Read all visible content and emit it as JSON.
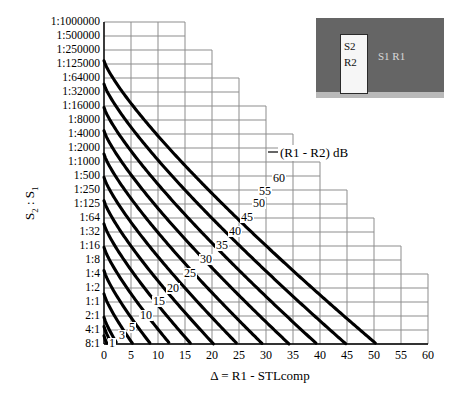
{
  "chart_data": {
    "type": "line",
    "title": "",
    "xlabel": "Δ = R1 - STLcomp",
    "ylabel": "S2 : S1",
    "legend_title": "(R1 - R2) dB",
    "legend_position": "inline-on-curves",
    "grid": true,
    "xlim": [
      0,
      60
    ],
    "xticks": [
      0,
      5,
      10,
      15,
      20,
      25,
      30,
      35,
      40,
      45,
      50,
      55,
      60
    ],
    "xticklabels": [
      "0",
      "5",
      "10",
      "15",
      "20",
      "25",
      "30",
      "35",
      "40",
      "45",
      "50",
      "55",
      "60"
    ],
    "yticklabels": [
      "1:1000000",
      "1:500000",
      "1:250000",
      "1:125000",
      "1:64000",
      "1:32000",
      "1:16000",
      "1:8000",
      "1:4000",
      "1:2000",
      "1:1000",
      "1:500",
      "1:250",
      "1:125",
      "1:64",
      "1:32",
      "1:16",
      "1:8",
      "1:4",
      "1:2",
      "1:1",
      "2:1",
      "4:1",
      "8:1"
    ],
    "y_scale": "log2-ratio",
    "series_label_unit": "dB",
    "series": [
      {
        "name": "1",
        "label": "1",
        "values_dB": 1
      },
      {
        "name": "3",
        "label": "3",
        "values_dB": 3
      },
      {
        "name": "5",
        "label": "5",
        "values_dB": 5
      },
      {
        "name": "10",
        "label": "10",
        "values_dB": 10
      },
      {
        "name": "15",
        "label": "15",
        "values_dB": 15
      },
      {
        "name": "20",
        "label": "20",
        "values_dB": 20
      },
      {
        "name": "25",
        "label": "25",
        "values_dB": 25
      },
      {
        "name": "30",
        "label": "30",
        "values_dB": 30
      },
      {
        "name": "35",
        "label": "35",
        "values_dB": 35
      },
      {
        "name": "40",
        "label": "40",
        "values_dB": 40
      },
      {
        "name": "45",
        "label": "45",
        "values_dB": 45
      },
      {
        "name": "50",
        "label": "50",
        "values_dB": 50
      },
      {
        "name": "55",
        "label": "55",
        "values_dB": 55
      },
      {
        "name": "60",
        "label": "60",
        "values_dB": 60
      }
    ]
  },
  "inset": {
    "name": "partition-diagram",
    "source_room_label": "S1  R1",
    "receiver_panel_line1": "S2",
    "receiver_panel_line2": "R2",
    "wall_color": "#656565",
    "door_color": "#f6f6f6",
    "floor_color": "#b9b9b9"
  },
  "colors": {
    "grid": "#8d8d8d",
    "curve": "#000000",
    "axis": "#000000",
    "background": "#ffffff"
  }
}
